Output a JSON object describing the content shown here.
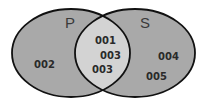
{
  "diagram": {
    "type": "venn",
    "colors": {
      "outer_fill": "#a9a9a9",
      "intersection_fill": "#d3d3d3",
      "stroke": "#111111",
      "background": "#ffffff"
    },
    "sets": [
      {
        "label": "P",
        "only_items": [
          "002"
        ]
      },
      {
        "label": "S",
        "only_items": [
          "004",
          "005"
        ]
      }
    ],
    "intersection": {
      "items": [
        "001",
        "003",
        "003"
      ]
    }
  }
}
